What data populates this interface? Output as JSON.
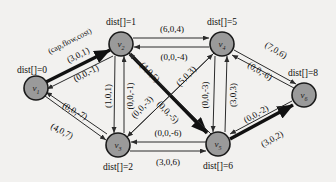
{
  "figure": {
    "background_color": "#f2f1ef",
    "node_fill": "#9a9a9a",
    "node_stroke": "#1a1a1a",
    "edge_color": "#2b2b2b",
    "highlight_color": "#111111"
  },
  "legend": {
    "text": "(cap,flow,cost)"
  },
  "nodes": [
    {
      "id": "v1",
      "label": "v",
      "sub": "1",
      "cx": 36,
      "cy": 88,
      "r": 12,
      "dist_label": "dist[]=0",
      "dist_x": 32,
      "dist_y": 70
    },
    {
      "id": "v2",
      "label": "v",
      "sub": "2",
      "cx": 121,
      "cy": 44,
      "r": 12,
      "dist_label": "dist[]=1",
      "dist_x": 121,
      "dist_y": 22
    },
    {
      "id": "v3",
      "label": "v",
      "sub": "3",
      "cx": 118,
      "cy": 145,
      "r": 12,
      "dist_label": "dist[]=2",
      "dist_x": 118,
      "dist_y": 167
    },
    {
      "id": "v4",
      "label": "v",
      "sub": "4",
      "cx": 222,
      "cy": 44,
      "r": 12,
      "dist_label": "dist[]=5",
      "dist_x": 222,
      "dist_y": 22
    },
    {
      "id": "v5",
      "label": "v",
      "sub": "5",
      "cx": 218,
      "cy": 144,
      "r": 12,
      "dist_label": "dist[]=6",
      "dist_x": 218,
      "dist_y": 166
    },
    {
      "id": "v6",
      "label": "v",
      "sub": "6",
      "cx": 304,
      "cy": 95,
      "r": 12,
      "dist_label": "dist[]=8",
      "dist_x": 303,
      "dist_y": 73
    }
  ],
  "edges": [
    {
      "from": "v1",
      "to": "v2",
      "label": "(3,0,1)",
      "bold": true,
      "lx": 78,
      "ly": 55,
      "rot": -27
    },
    {
      "from": "v2",
      "to": "v1",
      "label": "(0,0,-1)",
      "bold": false,
      "lx": 86,
      "ly": 73,
      "rot": -27
    },
    {
      "from": "v1",
      "to": "v3",
      "label": "(4,0,7)",
      "bold": false,
      "lx": 62,
      "ly": 131,
      "rot": 28
    },
    {
      "from": "v3",
      "to": "v1",
      "label": "(0,0,-7)",
      "bold": false,
      "lx": 73,
      "ly": 113,
      "rot": 28
    },
    {
      "from": "v2",
      "to": "v3",
      "label": "(1,0,1)",
      "bold": false,
      "lx": 108,
      "ly": 96,
      "rot": -90
    },
    {
      "from": "v3",
      "to": "v2",
      "label": "(0,0,-1)",
      "bold": false,
      "lx": 124,
      "ly": 96,
      "rot": -90
    },
    {
      "from": "v2",
      "to": "v4",
      "label": "(6,0,4)",
      "bold": false,
      "lx": 172,
      "ly": 29,
      "rot": 0
    },
    {
      "from": "v4",
      "to": "v2",
      "label": "(0,0,-4)",
      "bold": false,
      "lx": 174,
      "ly": 52,
      "rot": 0
    },
    {
      "from": "v2",
      "to": "v5",
      "label": "(4,0,5)",
      "bold": true,
      "lx": 147,
      "ly": 70,
      "rot": 46
    },
    {
      "from": "v5",
      "to": "v2",
      "label": "(0,0,-5)",
      "bold": false,
      "lx": 163,
      "ly": 110,
      "rot": 46
    },
    {
      "from": "v3",
      "to": "v4",
      "label": "(5,0,3)",
      "bold": false,
      "lx": 185,
      "ly": 75,
      "rot": -46
    },
    {
      "from": "v4",
      "to": "v3",
      "label": "(0,0,-3)",
      "bold": false,
      "lx": 139,
      "ly": 105,
      "rot": -46
    },
    {
      "from": "v3",
      "to": "v5",
      "label": "(3,0,6)",
      "bold": false,
      "lx": 168,
      "ly": 158,
      "rot": 0
    },
    {
      "from": "v5",
      "to": "v3",
      "label": "(0,0,-6)",
      "bold": false,
      "lx": 168,
      "ly": 134,
      "rot": 0
    },
    {
      "from": "v4",
      "to": "v5",
      "label": "(0,0,-3)",
      "bold": false,
      "lx": 208,
      "ly": 95,
      "rot": -90
    },
    {
      "from": "v5",
      "to": "v4",
      "label": "(3,0,3)",
      "bold": false,
      "lx": 230,
      "ly": 95,
      "rot": -90
    },
    {
      "from": "v4",
      "to": "v6",
      "label": "(7,0,6)",
      "bold": false,
      "lx": 273,
      "ly": 52,
      "rot": 31
    },
    {
      "from": "v6",
      "to": "v4",
      "label": "(0,0,-6)",
      "bold": false,
      "lx": 258,
      "ly": 70,
      "rot": 31
    },
    {
      "from": "v5",
      "to": "v6",
      "label": "(3,0,2)",
      "bold": true,
      "lx": 274,
      "ly": 137,
      "rot": -30
    },
    {
      "from": "v6",
      "to": "v5",
      "label": "(0,0,-2)",
      "bold": false,
      "lx": 258,
      "ly": 114,
      "rot": -30
    }
  ]
}
